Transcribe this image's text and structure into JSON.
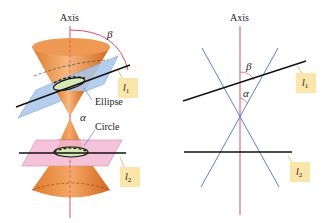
{
  "figure": {
    "left_panel": {
      "axis_label": "Axis",
      "beta_label": "β",
      "alpha_label": "α",
      "ellipse_label": "Ellipse",
      "circle_label": "Circle",
      "line1_tag": {
        "letter": "l",
        "sub": "1"
      },
      "line2_tag": {
        "letter": "l",
        "sub": "2"
      }
    },
    "right_panel": {
      "axis_label": "Axis",
      "beta_label": "β",
      "alpha_label": "α",
      "line1_tag": {
        "letter": "l",
        "sub": "1"
      },
      "line2_tag": {
        "letter": "l",
        "sub": "2"
      }
    }
  },
  "colors": {
    "axis": "#d9506a",
    "cone_fill": "#e8883c",
    "cone_light": "#f7c79a",
    "plane_blue": "#a9c6ea",
    "plane_pink": "#f2b9d2",
    "section_fill": "#d6e8b4",
    "generator_blue": "#5b82c9",
    "tag_fill": "#f9e6a8",
    "line": "#111111"
  }
}
